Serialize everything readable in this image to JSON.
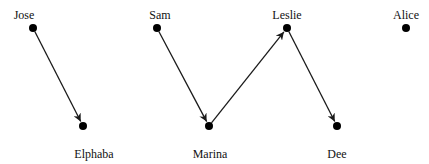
{
  "diagram": {
    "type": "directed-graph",
    "nodes": [
      {
        "id": "jose",
        "label": "Jose",
        "x": 33,
        "y": 28,
        "lx": 24,
        "ly": 19
      },
      {
        "id": "sam",
        "label": "Sam",
        "x": 157,
        "y": 28,
        "lx": 160,
        "ly": 19
      },
      {
        "id": "leslie",
        "label": "Leslie",
        "x": 287,
        "y": 28,
        "lx": 287,
        "ly": 19
      },
      {
        "id": "alice",
        "label": "Alice",
        "x": 406,
        "y": 28,
        "lx": 406,
        "ly": 19
      },
      {
        "id": "elphaba",
        "label": "Elphaba",
        "x": 83,
        "y": 126,
        "lx": 94,
        "ly": 158
      },
      {
        "id": "marina",
        "label": "Marina",
        "x": 209,
        "y": 126,
        "lx": 210,
        "ly": 158
      },
      {
        "id": "dee",
        "label": "Dee",
        "x": 337,
        "y": 126,
        "lx": 337,
        "ly": 158
      }
    ],
    "edges": [
      {
        "from": "jose",
        "to": "elphaba"
      },
      {
        "from": "sam",
        "to": "marina"
      },
      {
        "from": "marina",
        "to": "leslie"
      },
      {
        "from": "leslie",
        "to": "dee"
      }
    ],
    "colors": {
      "node": "#000000",
      "edge": "#1a1a1a",
      "label": "#111111"
    }
  }
}
